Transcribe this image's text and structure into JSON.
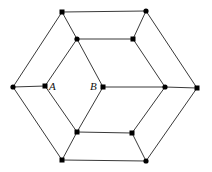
{
  "diagram": {
    "type": "graph",
    "labels": [
      {
        "id": "A",
        "text": "A",
        "x": 49,
        "y": 81
      },
      {
        "id": "B",
        "text": "B",
        "x": 90,
        "y": 81
      }
    ],
    "nodes": [
      {
        "id": "o_tl",
        "x": 62,
        "y": 12,
        "shape": "square"
      },
      {
        "id": "o_tr",
        "x": 146,
        "y": 11,
        "shape": "circle"
      },
      {
        "id": "o_r",
        "x": 197,
        "y": 88,
        "shape": "square"
      },
      {
        "id": "o_br",
        "x": 146,
        "y": 161,
        "shape": "circle"
      },
      {
        "id": "o_bl",
        "x": 62,
        "y": 160,
        "shape": "square"
      },
      {
        "id": "o_l",
        "x": 13,
        "y": 87,
        "shape": "circle"
      },
      {
        "id": "i_tl",
        "x": 77,
        "y": 39,
        "shape": "circle"
      },
      {
        "id": "i_tr",
        "x": 133,
        "y": 39,
        "shape": "square"
      },
      {
        "id": "i_r",
        "x": 165,
        "y": 87,
        "shape": "circle"
      },
      {
        "id": "i_br",
        "x": 132,
        "y": 133,
        "shape": "square"
      },
      {
        "id": "i_bl",
        "x": 77,
        "y": 132,
        "shape": "square"
      },
      {
        "id": "A",
        "x": 45,
        "y": 86,
        "shape": "square"
      },
      {
        "id": "B",
        "x": 103,
        "y": 87,
        "shape": "square"
      }
    ],
    "edges": [
      [
        "o_tl",
        "o_tr"
      ],
      [
        "o_tr",
        "o_r"
      ],
      [
        "o_r",
        "o_br"
      ],
      [
        "o_br",
        "o_bl"
      ],
      [
        "o_bl",
        "o_l"
      ],
      [
        "o_l",
        "o_tl"
      ],
      [
        "i_tl",
        "i_tr"
      ],
      [
        "i_tr",
        "i_r"
      ],
      [
        "i_r",
        "i_br"
      ],
      [
        "i_br",
        "i_bl"
      ],
      [
        "i_bl",
        "A"
      ],
      [
        "A",
        "i_tl"
      ],
      [
        "i_tl",
        "B"
      ],
      [
        "B",
        "i_bl"
      ],
      [
        "B",
        "i_r"
      ],
      [
        "o_tl",
        "i_tl"
      ],
      [
        "o_tr",
        "i_tr"
      ],
      [
        "o_r",
        "i_r"
      ],
      [
        "o_br",
        "i_br"
      ],
      [
        "o_bl",
        "i_bl"
      ],
      [
        "o_l",
        "A"
      ]
    ]
  }
}
